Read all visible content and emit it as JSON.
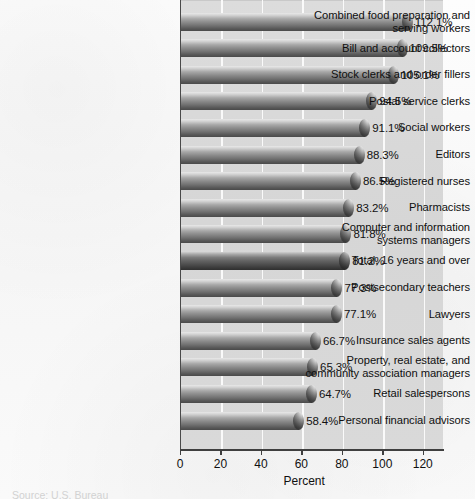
{
  "chart_data": {
    "type": "bar",
    "orientation": "horizontal",
    "title": "",
    "xlabel": "Percent",
    "ylabel": "",
    "xlim": [
      0,
      130
    ],
    "xticks": [
      0,
      20,
      40,
      60,
      80,
      100,
      120
    ],
    "xtick_labels": [
      "0",
      "20",
      "40",
      "60",
      "80",
      "100",
      "120"
    ],
    "grid": true,
    "grid_axis": "x",
    "legend": "none",
    "value_suffix": "%",
    "categories": [
      "Combined food preparation and serving workers",
      "Bill and account collectors",
      "Stock clerks and order fillers",
      "Postal service clerks",
      "Social workers",
      "Editors",
      "Registered nurses",
      "Pharmacists",
      "Computer and information systems managers",
      "Total, 16 years and over",
      "Postsecondary teachers",
      "Lawyers",
      "Insurance sales agents",
      "Property, real estate, and community association managers",
      "Retail salespersons",
      "Personal financial advisors"
    ],
    "values": [
      112.1,
      109.5,
      105.1,
      94.5,
      91.1,
      88.3,
      86.5,
      83.2,
      81.8,
      81.2,
      77.3,
      77.1,
      66.7,
      65.3,
      64.7,
      58.4
    ],
    "value_labels": [
      "112.1%",
      "109.5%",
      "105.1%",
      "94.5%",
      "91.1%",
      "88.3%",
      "86.5%",
      "83.2%",
      "81.8%",
      "81.2%",
      "77.3%",
      "77.1%",
      "66.7%",
      "65.3%",
      "64.7%",
      "58.4%"
    ],
    "highlighted_category": "Total, 16 years and over",
    "bar_style": "3d-cylinder",
    "bar_color": "#7a7a7a",
    "highlight_bar_color": "#4e4e4e",
    "plot_background_color": "#d8d8d8",
    "gridline_color": "#fafafa",
    "page_background_color": "#fbfbfb"
  },
  "category_lines": [
    [
      "Combined food preparation and",
      "serving workers"
    ],
    [
      "Bill and account collectors"
    ],
    [
      "Stock clerks and order fillers"
    ],
    [
      "Postal service clerks"
    ],
    [
      "Social workers"
    ],
    [
      "Editors"
    ],
    [
      "Registered nurses"
    ],
    [
      "Pharmacists"
    ],
    [
      "Computer and information",
      "systems managers"
    ],
    [
      "Total, 16 years and over"
    ],
    [
      "Postsecondary teachers"
    ],
    [
      "Lawyers"
    ],
    [
      "Insurance sales agents"
    ],
    [
      "Property, real estate, and",
      "community association managers"
    ],
    [
      "Retail salespersons"
    ],
    [
      "Personal financial advisors"
    ]
  ],
  "footer": {
    "source_note": "Source: U.S. Bureau"
  }
}
